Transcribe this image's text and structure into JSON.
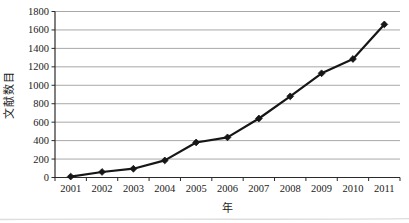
{
  "chart_data": {
    "type": "line",
    "categories": [
      "2001",
      "2002",
      "2003",
      "2004",
      "2005",
      "2006",
      "2007",
      "2008",
      "2009",
      "2010",
      "2011"
    ],
    "series": [
      {
        "name": "文献数目",
        "values": [
          10,
          60,
          95,
          185,
          380,
          435,
          640,
          880,
          1130,
          1285,
          1660
        ]
      }
    ],
    "title": "",
    "xlabel": "年",
    "ylabel": "文献数目",
    "ylim": [
      0,
      1800
    ],
    "ytick_step": 200,
    "yticks": [
      0,
      200,
      400,
      600,
      800,
      1000,
      1200,
      1400,
      1600,
      1800
    ],
    "grid": true,
    "legend_position": "none",
    "marker": "diamond",
    "line_color": "#161616",
    "marker_color": "#161616",
    "gridline_color": "#a8a8a8",
    "axis_color": "#2b2b2b",
    "tick_label_color": "#1a1a1a",
    "background_color": "#ffffff",
    "scan_artifact_color": "#d9d9d9"
  }
}
